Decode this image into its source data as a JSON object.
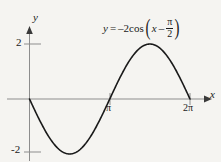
{
  "figure": {
    "background_color": "#f5f4f1",
    "curve_color": "#1a1a1a",
    "axis_color": "#8a8a8a",
    "text_color": "#1a1a1a"
  },
  "axes": {
    "x_axis_label": "x",
    "y_axis_label": "y",
    "x_ticks": [
      {
        "label": "π",
        "value": 3.14159
      },
      {
        "label": "2π",
        "value": 6.28319
      }
    ],
    "y_ticks": [
      {
        "label": "2",
        "value": 2
      },
      {
        "label": "-2",
        "value": -2
      }
    ]
  },
  "equation": {
    "lhs": "y",
    "equals": "=",
    "coefficient": "–2",
    "function": "cos",
    "arg_variable": "x",
    "arg_operator": "–",
    "arg_fraction_numerator": "π",
    "arg_fraction_denominator": "2",
    "plain_text": "y = –2cos(x – π/2)"
  },
  "chart_data": {
    "type": "line",
    "title": "",
    "subtitle": "",
    "xlabel": "x",
    "ylabel": "y",
    "annotations": [
      "y = –2cos(x – π/2)"
    ],
    "legend": [],
    "legend_position": "none",
    "grid": false,
    "xlim": [
      -0.45,
      7.3
    ],
    "ylim": [
      -2.6,
      2.9
    ],
    "xticks": [
      3.14159,
      6.28319
    ],
    "xticklabels": [
      "π",
      "2π"
    ],
    "yticks": [
      2,
      -2
    ],
    "yticklabels": [
      "2",
      "-2"
    ],
    "series": [
      {
        "name": "y = –2cos(x – π/2)",
        "color": "#1a1a1a",
        "formula": "y = -2*cos(x - pi/2)",
        "equivalent": "y = -2*sin(x)",
        "amplitude": 2,
        "period": 6.28319,
        "phase_shift": 1.5708,
        "x_domain": [
          0,
          6.28319
        ],
        "x": [
          0,
          0.3927,
          0.7854,
          1.1781,
          1.5708,
          1.9635,
          2.3562,
          2.7489,
          3.14159,
          3.5343,
          3.927,
          4.3197,
          4.7124,
          5.1051,
          5.4978,
          5.8905,
          6.28319
        ],
        "y": [
          0,
          -0.7654,
          -1.4142,
          -1.8478,
          -2,
          -1.8478,
          -1.4142,
          -0.7654,
          0,
          0.7654,
          1.4142,
          1.8478,
          2,
          1.8478,
          1.4142,
          0.7654,
          0
        ],
        "key_points": [
          {
            "label": "start",
            "x": 0,
            "y": 0
          },
          {
            "label": "minimum",
            "x": 1.5708,
            "y": -2
          },
          {
            "label": "zero-crossing",
            "x": 3.14159,
            "y": 0
          },
          {
            "label": "maximum",
            "x": 4.7124,
            "y": 2
          },
          {
            "label": "end",
            "x": 6.28319,
            "y": 0
          }
        ]
      }
    ]
  }
}
